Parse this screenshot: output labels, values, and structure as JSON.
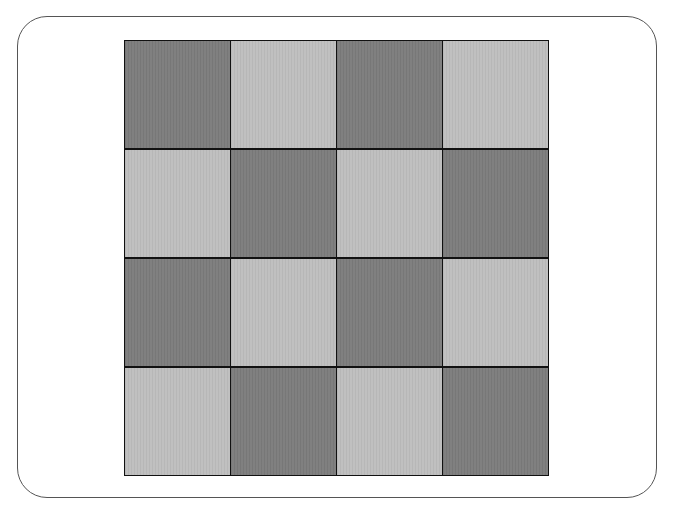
{
  "board": {
    "rows": 4,
    "cols": 4,
    "colors": {
      "dark": "#7c7c7c",
      "light": "#bebebe",
      "grid_line": "#111111",
      "frame_border": "#555555"
    },
    "pattern": [
      [
        "dark",
        "light",
        "dark",
        "light"
      ],
      [
        "light",
        "dark",
        "light",
        "dark"
      ],
      [
        "dark",
        "light",
        "dark",
        "light"
      ],
      [
        "light",
        "dark",
        "light",
        "dark"
      ]
    ]
  }
}
